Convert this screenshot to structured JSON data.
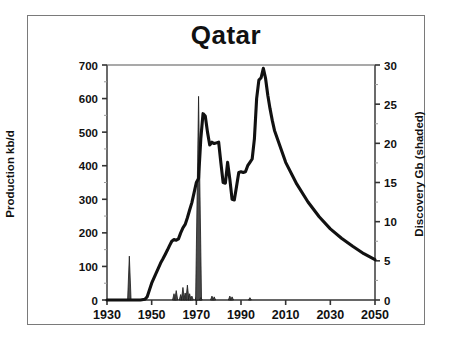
{
  "figure": {
    "title": "Qatar",
    "border_color": "#7a7a7a",
    "background": "#ffffff",
    "curve_color": "#111111"
  },
  "axes": {
    "left": {
      "title": "Production kb/d",
      "ticks": [
        "0",
        "100",
        "200",
        "300",
        "400",
        "500",
        "600",
        "700"
      ],
      "min": 0,
      "max": 700
    },
    "right": {
      "title": "Discovery Gb (shaded)",
      "ticks": [
        "0",
        "5",
        "10",
        "15",
        "20",
        "25",
        "30"
      ],
      "min": 0,
      "max": 30
    },
    "bottom": {
      "title": "",
      "ticks": [
        "1930",
        "1950",
        "1970",
        "1990",
        "2010",
        "2030",
        "2050"
      ],
      "min": 1930,
      "max": 2050
    }
  },
  "chart_data": {
    "type": "line",
    "title": "Qatar",
    "xlabel": "",
    "ylabel": "Production kb/d",
    "y2label": "Discovery Gb (shaded)",
    "xlim": [
      1930,
      2050
    ],
    "ylim": [
      0,
      700
    ],
    "y2lim": [
      0,
      30
    ],
    "grid": false,
    "legend": "none",
    "series": [
      {
        "name": "Production kb/d",
        "axis": "left",
        "type": "line",
        "x": [
          1930,
          1935,
          1940,
          1945,
          1947,
          1948,
          1949,
          1950,
          1951,
          1952,
          1953,
          1954,
          1955,
          1956,
          1957,
          1958,
          1959,
          1960,
          1961,
          1962,
          1963,
          1964,
          1965,
          1966,
          1967,
          1968,
          1969,
          1970,
          1971,
          1972,
          1973,
          1974,
          1975,
          1976,
          1977,
          1978,
          1979,
          1980,
          1981,
          1982,
          1983,
          1984,
          1985,
          1986,
          1987,
          1988,
          1989,
          1990,
          1991,
          1992,
          1993,
          1994,
          1995,
          1996,
          1997,
          1998,
          1999,
          2000,
          2001,
          2002,
          2003,
          2004,
          2005,
          2010,
          2015,
          2020,
          2025,
          2030,
          2035,
          2040,
          2045,
          2050
        ],
        "y": [
          0,
          0,
          0,
          0,
          2,
          10,
          30,
          50,
          65,
          80,
          95,
          110,
          122,
          135,
          148,
          162,
          175,
          180,
          178,
          182,
          200,
          215,
          225,
          245,
          268,
          290,
          320,
          350,
          362,
          480,
          555,
          548,
          500,
          462,
          470,
          466,
          468,
          470,
          408,
          350,
          348,
          410,
          360,
          300,
          298,
          338,
          380,
          382,
          380,
          382,
          400,
          410,
          420,
          480,
          600,
          655,
          662,
          690,
          660,
          610,
          570,
          535,
          505,
          410,
          345,
          292,
          248,
          212,
          184,
          160,
          138,
          120
        ]
      },
      {
        "name": "Discovery Gb (shaded)",
        "axis": "right",
        "type": "spike",
        "x": [
          1939,
          1940,
          1941,
          1960,
          1961,
          1963,
          1964,
          1965,
          1966,
          1967,
          1968,
          1970,
          1971,
          1972,
          1977,
          1978,
          1985,
          1986,
          1994
        ],
        "y": [
          0,
          5.6,
          0,
          0.8,
          1.2,
          0.7,
          1.6,
          0.9,
          1.9,
          0.8,
          0.5,
          0.4,
          26.0,
          0.3,
          0.5,
          0.4,
          0.5,
          0.4,
          0.3
        ]
      }
    ],
    "annotations": [
      {
        "text": "Production peak ~690 kb/d around 2000"
      },
      {
        "text": "Largest discovery spike ~26 Gb around 1971"
      },
      {
        "text": "Early discovery spike ~5.6 Gb around 1940"
      }
    ]
  }
}
